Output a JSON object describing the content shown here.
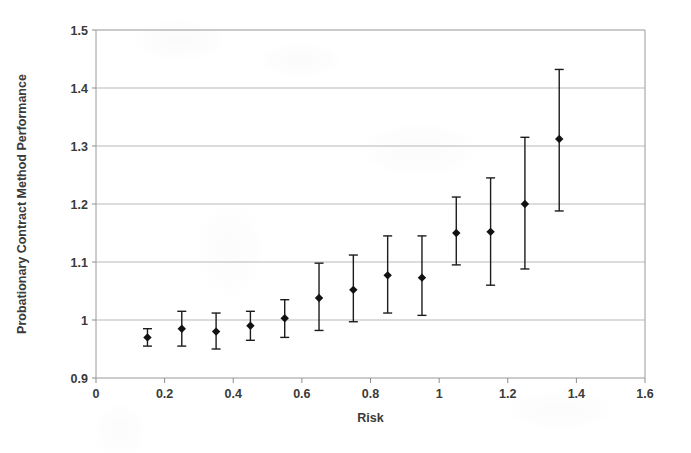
{
  "chart_data": {
    "type": "scatter",
    "title": "",
    "xlabel": "Risk",
    "ylabel": "Probationary Contract Method Performance",
    "xlim": [
      0,
      1.6
    ],
    "ylim": [
      0.9,
      1.5
    ],
    "xticks": [
      "0",
      "0.2",
      "0.4",
      "0.6",
      "0.8",
      "1",
      "1.2",
      "1.4",
      "1.6"
    ],
    "xtick_values": [
      0,
      0.2,
      0.4,
      0.6,
      0.8,
      1.0,
      1.2,
      1.4,
      1.6
    ],
    "yticks": [
      "0.9",
      "1",
      "1.1",
      "1.2",
      "1.3",
      "1.4",
      "1.5"
    ],
    "ytick_values": [
      0.9,
      1.0,
      1.1,
      1.2,
      1.3,
      1.4,
      1.5
    ],
    "grid": "horizontal",
    "legend": "none",
    "marker_style": "filled-diamond",
    "error_bars": "vertical-with-caps",
    "x": [
      0.15,
      0.25,
      0.35,
      0.45,
      0.55,
      0.65,
      0.75,
      0.85,
      0.95,
      1.05,
      1.15,
      1.25,
      1.35
    ],
    "y": [
      0.97,
      0.985,
      0.98,
      0.99,
      1.003,
      1.038,
      1.052,
      1.077,
      1.073,
      1.15,
      1.152,
      1.2,
      1.312
    ],
    "y_lower": [
      0.955,
      0.955,
      0.95,
      0.965,
      0.97,
      0.982,
      0.997,
      1.012,
      1.008,
      1.095,
      1.06,
      1.088,
      1.188
    ],
    "y_upper": [
      0.985,
      1.015,
      1.012,
      1.015,
      1.035,
      1.098,
      1.112,
      1.145,
      1.145,
      1.212,
      1.245,
      1.315,
      1.432
    ]
  },
  "colors": {
    "marker": "#121212",
    "error_bar": "#1c1c1c",
    "gridline": "#b9b9b9",
    "axis": "#9a9a9a",
    "text": "#3a3a3a",
    "background": "#ffffff"
  }
}
